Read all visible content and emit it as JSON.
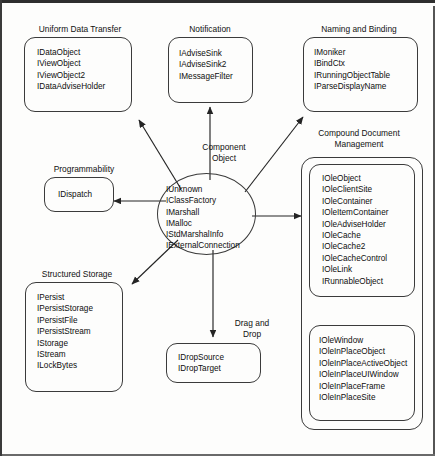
{
  "diagram": {
    "title_center": "Component\nObject",
    "center_interfaces": "IUnknown\nIClassFactory\nIMarshall\nIMalloc\nIStdMarshalInfo\nIExternalConnection",
    "groups": {
      "uniform_data_transfer": {
        "caption": "Uniform Data Transfer",
        "interfaces": "IDataObject\nIViewObject\nIViewObject2\nIDataAdviseHolder"
      },
      "notification": {
        "caption": "Notification",
        "interfaces": "IAdviseSink\nIAdviseSink2\nIMessageFilter"
      },
      "naming_and_binding": {
        "caption": "Naming and Binding",
        "interfaces": "IMoniker\nIBindCtx\nIRunningObjectTable\nIParseDisplayName"
      },
      "programmability": {
        "caption": "Programmability",
        "interfaces": "IDispatch"
      },
      "structured_storage": {
        "caption": "Structured Storage",
        "interfaces": "IPersist\nIPersistStorage\nIPersistFile\nIPersistStream\nIStorage\nIStream\nILockBytes"
      },
      "drag_and_drop": {
        "caption": "Drag and\nDrop",
        "interfaces": "IDropSource\nIDropTarget"
      },
      "compound_document_management": {
        "caption": "Compound Document\nManagement",
        "interfaces_primary": "IOleObject\nIOleClientSite\nIOleContainer\nIOleItemContainer\nIOleAdviseHolder\nIOleCache\nIOleCache2\nIOleCacheControl\nIOleLink\nIRunnableObject",
        "interfaces_inplace": "IOleWindow\nIOleInPlaceObject\nIOleInPlaceActiveObject\nIOleInPlaceUIWindow\nIOleInPlaceFrame\nIOleInPlaceSite"
      }
    },
    "colors": {
      "ink": "#0d0d0d",
      "stroke": "#3b3b3b",
      "page": "#fdfdfc"
    }
  }
}
